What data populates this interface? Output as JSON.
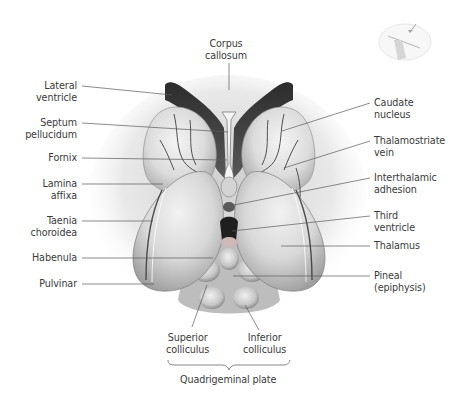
{
  "figure": {
    "type": "anatomical-illustration",
    "colors": {
      "background": "#ffffff",
      "label_text": "#3a3a3a",
      "leader_line": "#555555",
      "ventricle_dark": "#3a3a3a",
      "tissue_light": "#e6e6e6",
      "tissue_shadow": "#9a9a9a"
    }
  },
  "labels": {
    "corpus_callosum": {
      "line1": "Corpus",
      "line2": "callosum"
    },
    "lateral_ventricle": {
      "line1": "Lateral",
      "line2": "ventricle"
    },
    "septum_pellucidum": {
      "line1": "Septum",
      "line2": "pellucidum"
    },
    "fornix": {
      "line1": "Fornix"
    },
    "lamina_affixa": {
      "line1": "Lamina",
      "line2": "affixa"
    },
    "taenia_choroidea": {
      "line1": "Taenia",
      "line2": "choroidea"
    },
    "habenula": {
      "line1": "Habenula"
    },
    "pulvinar": {
      "line1": "Pulvinar"
    },
    "caudate_nucleus": {
      "line1": "Caudate",
      "line2": "nucleus"
    },
    "thalamostriate_vein": {
      "line1": "Thalamostriate",
      "line2": "vein"
    },
    "interthalamic_adhesion": {
      "line1": "Interthalamic",
      "line2": "adhesion"
    },
    "third_ventricle": {
      "line1": "Third",
      "line2": "ventricle"
    },
    "thalamus": {
      "line1": "Thalamus"
    },
    "pineal": {
      "line1": "Pineal",
      "line2": "(epiphysis)"
    },
    "superior_colliculus": {
      "line1": "Superior",
      "line2": "colliculus"
    },
    "inferior_colliculus": {
      "line1": "Inferior",
      "line2": "colliculus"
    },
    "quadrigeminal_plate": {
      "line1": "Quadrigeminal plate"
    }
  },
  "inset": {
    "description": "orientation thumbnail of brain with arrow indicating viewing direction"
  }
}
